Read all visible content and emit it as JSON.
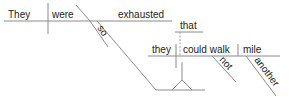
{
  "diagram": {
    "type": "Reed-Kellogg sentence diagram",
    "sentence": "They were so exhausted that they could not walk another mile.",
    "main_clause": {
      "subject": "They",
      "verb": "were",
      "predicate_adjective": "exhausted",
      "modifier_of_adjective": "so"
    },
    "connector": "that",
    "subordinate_clause": {
      "subject": "they",
      "verb": "could walk",
      "object": "mile",
      "adverb": "not",
      "object_modifier": "another"
    }
  },
  "colors": {
    "text": "#222222",
    "line": "#8a8a8a",
    "background": "#ffffff"
  }
}
